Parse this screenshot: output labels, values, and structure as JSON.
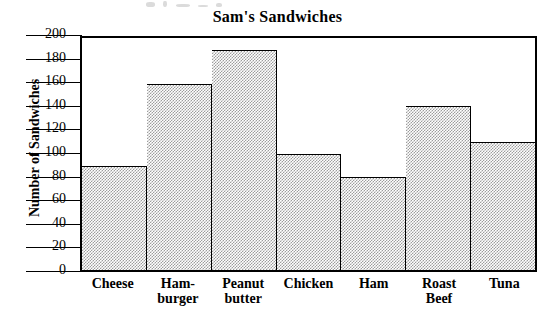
{
  "chart_data": {
    "type": "bar",
    "title": "Sam's Sandwiches",
    "xlabel": "",
    "ylabel": "Number of Sandwiches",
    "categories": [
      "Cheese",
      "Ham-\nburger",
      "Peanut\nbutter",
      "Chicken",
      "Ham",
      "Roast\nBeef",
      "Tuna"
    ],
    "values": [
      90,
      160,
      190,
      100,
      80,
      141,
      110
    ],
    "ylim": [
      0,
      200
    ],
    "ytick_labels": [
      "200",
      "180",
      "160",
      "140",
      "120",
      "100",
      "80",
      "60",
      "40",
      "20",
      "0"
    ],
    "ytick_values": [
      200,
      180,
      160,
      140,
      120,
      100,
      80,
      60,
      40,
      20,
      0
    ],
    "ytick_step": 20,
    "grid": false,
    "legend": null,
    "bar_fill": "checkerboard-dither-gray",
    "bar_fill_color": "#9d9d9d",
    "bar_outline_color": "#000000",
    "background_color": "#ffffff"
  }
}
